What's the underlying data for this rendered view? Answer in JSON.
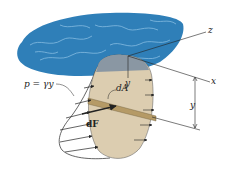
{
  "figure": {
    "labels": {
      "pressure": "p = γy",
      "dA": "dA",
      "dF": "dF",
      "y_plate": "y",
      "y_dim": "y",
      "axis_z": "z",
      "axis_x": "x"
    },
    "colors": {
      "water": "#2f7fb8",
      "water_light": "#8fc3e6",
      "plate": "#dccdb0",
      "plate_submerged_top": "#8a97a3",
      "strip": "#b59a66",
      "lines": "#222222"
    }
  }
}
